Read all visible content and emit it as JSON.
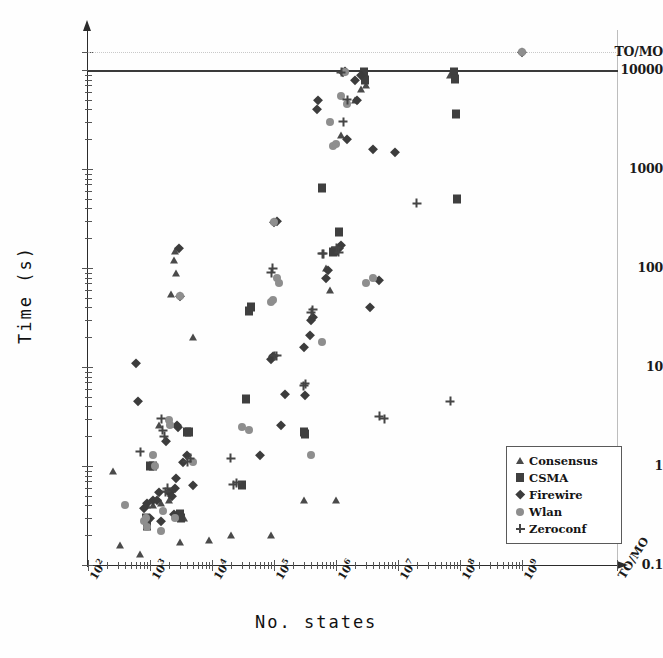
{
  "chart_data": {
    "type": "scatter",
    "title": "",
    "xlabel": "No. states",
    "ylabel": "Time (s)",
    "xscale": "log",
    "yscale": "log",
    "xlim": [
      100,
      1000000000
    ],
    "ylim": [
      0.1,
      10000
    ],
    "grid": false,
    "legend_position": "bottom-right",
    "x_tick_labels": [
      "10^2",
      "10^3",
      "10^4",
      "10^5",
      "10^6",
      "10^7",
      "10^8",
      "10^9",
      "TO/MO"
    ],
    "y_tick_labels": [
      "0.1",
      "1",
      "10",
      "100",
      "1000",
      "10000",
      "TO/MO"
    ],
    "threshold_line_solid": 10000,
    "threshold_line_dotted": "TO/MO",
    "series": [
      {
        "name": "Consensus",
        "marker": "triangle",
        "color": "#4a4a4a",
        "points": [
          [
            250,
            0.9
          ],
          [
            330,
            0.16
          ],
          [
            700,
            0.13
          ],
          [
            900,
            0.4
          ],
          [
            1100,
            0.4
          ],
          [
            1400,
            2.6
          ],
          [
            1500,
            0.42
          ],
          [
            2000,
            0.45
          ],
          [
            2200,
            55
          ],
          [
            2400,
            120
          ],
          [
            2500,
            150
          ],
          [
            2600,
            90
          ],
          [
            3000,
            0.17
          ],
          [
            3500,
            0.3
          ],
          [
            5000,
            20
          ],
          [
            9000,
            0.18
          ],
          [
            20000,
            0.2
          ],
          [
            90000,
            0.2
          ],
          [
            300000,
            0.45
          ],
          [
            700000,
            100
          ],
          [
            800000,
            60
          ],
          [
            900000,
            150
          ],
          [
            1000000,
            0.45
          ],
          [
            1200000,
            2200
          ],
          [
            2000000,
            5000
          ],
          [
            2500000,
            6500
          ],
          [
            3000000,
            7000
          ],
          [
            70000000,
            9000
          ]
        ]
      },
      {
        "name": "CSMA",
        "marker": "square",
        "color": "#3f3f3f",
        "points": [
          [
            850,
            0.3
          ],
          [
            900,
            0.25
          ],
          [
            1000,
            1.0
          ],
          [
            1100,
            1.0
          ],
          [
            3000,
            0.33
          ],
          [
            3200,
            0.3
          ],
          [
            4000,
            2.2
          ],
          [
            4200,
            2.2
          ],
          [
            30000,
            0.65
          ],
          [
            35000,
            4.8
          ],
          [
            40000,
            37
          ],
          [
            42000,
            40
          ],
          [
            300000,
            2.2
          ],
          [
            320000,
            2.1
          ],
          [
            600000,
            650
          ],
          [
            900000,
            145
          ],
          [
            950000,
            150
          ],
          [
            1100000,
            230
          ],
          [
            2800000,
            9500
          ],
          [
            2900000,
            8000
          ],
          [
            80000000,
            9500
          ],
          [
            82000000,
            8200
          ],
          [
            85000000,
            3600
          ],
          [
            90000000,
            500
          ]
        ]
      },
      {
        "name": "Firewire",
        "marker": "diamond",
        "color": "#3c3c3c",
        "points": [
          [
            600,
            11
          ],
          [
            650,
            4.5
          ],
          [
            800,
            0.38
          ],
          [
            900,
            0.42
          ],
          [
            1000,
            0.3
          ],
          [
            1100,
            0.45
          ],
          [
            1300,
            0.45
          ],
          [
            1400,
            0.55
          ],
          [
            1500,
            0.28
          ],
          [
            1800,
            1.8
          ],
          [
            2000,
            0.55
          ],
          [
            2100,
            0.55
          ],
          [
            2300,
            0.5
          ],
          [
            2400,
            0.33
          ],
          [
            2500,
            0.6
          ],
          [
            2600,
            0.75
          ],
          [
            2700,
            2.6
          ],
          [
            2800,
            2.5
          ],
          [
            2900,
            160
          ],
          [
            3000,
            52
          ],
          [
            3400,
            1.1
          ],
          [
            4000,
            1.3
          ],
          [
            5000,
            0.65
          ],
          [
            60000,
            1.3
          ],
          [
            90000,
            12
          ],
          [
            95000,
            13
          ],
          [
            100000,
            290
          ],
          [
            110000,
            300
          ],
          [
            130000,
            2.6
          ],
          [
            150000,
            5.3
          ],
          [
            300000,
            16
          ],
          [
            320000,
            5.2
          ],
          [
            380000,
            21
          ],
          [
            400000,
            30
          ],
          [
            420000,
            32
          ],
          [
            500000,
            4000
          ],
          [
            520000,
            5000
          ],
          [
            700000,
            80
          ],
          [
            750000,
            95
          ],
          [
            1100000,
            160
          ],
          [
            1200000,
            170
          ],
          [
            1300000,
            9500
          ],
          [
            1400000,
            9800
          ],
          [
            1500000,
            2000
          ],
          [
            2000000,
            8000
          ],
          [
            2200000,
            5000
          ],
          [
            2500000,
            9000
          ],
          [
            3500000,
            40
          ],
          [
            4000000,
            1600
          ],
          [
            5000000,
            75
          ],
          [
            9000000,
            1500
          ],
          [
            1000000000,
            12000
          ]
        ]
      },
      {
        "name": "Wlan",
        "marker": "circle",
        "color": "#8e8e8e",
        "points": [
          [
            400,
            0.4
          ],
          [
            800,
            0.28
          ],
          [
            850,
            0.3
          ],
          [
            900,
            0.24
          ],
          [
            1100,
            1.3
          ],
          [
            1200,
            1.0
          ],
          [
            1500,
            0.22
          ],
          [
            1600,
            0.35
          ],
          [
            2000,
            2.9
          ],
          [
            2100,
            2.6
          ],
          [
            2500,
            0.3
          ],
          [
            3000,
            52
          ],
          [
            5000,
            1.1
          ],
          [
            30000,
            2.5
          ],
          [
            40000,
            2.3
          ],
          [
            90000,
            45
          ],
          [
            95000,
            47
          ],
          [
            100000,
            290
          ],
          [
            110000,
            80
          ],
          [
            120000,
            70
          ],
          [
            400000,
            1.3
          ],
          [
            600000,
            18
          ],
          [
            800000,
            3000
          ],
          [
            900000,
            1700
          ],
          [
            1000000,
            1800
          ],
          [
            1200000,
            5500
          ],
          [
            1400000,
            9500
          ],
          [
            1500000,
            4500
          ],
          [
            3000000,
            70
          ],
          [
            4000000,
            80
          ],
          [
            1000000000,
            12000
          ]
        ]
      },
      {
        "name": "Zeroconf",
        "marker": "plus",
        "color": "#454545",
        "points": [
          [
            700,
            1.4
          ],
          [
            1500,
            3.0
          ],
          [
            1600,
            2.3
          ],
          [
            1700,
            2.0
          ],
          [
            1800,
            0.55
          ],
          [
            1900,
            0.6
          ],
          [
            4000,
            1.1
          ],
          [
            4500,
            1.2
          ],
          [
            20000,
            1.2
          ],
          [
            22000,
            0.65
          ],
          [
            25000,
            0.68
          ],
          [
            90000,
            90
          ],
          [
            95000,
            100
          ],
          [
            100000,
            13
          ],
          [
            110000,
            13
          ],
          [
            300000,
            6.5
          ],
          [
            320000,
            6.8
          ],
          [
            400000,
            36
          ],
          [
            420000,
            38
          ],
          [
            600000,
            140
          ],
          [
            620000,
            140
          ],
          [
            1000000,
            160
          ],
          [
            1100000,
            145
          ],
          [
            1200000,
            9500
          ],
          [
            1300000,
            3000
          ],
          [
            1500000,
            5000
          ],
          [
            5000000,
            3.2
          ],
          [
            6000000,
            3.0
          ],
          [
            20000000,
            450
          ],
          [
            70000000,
            4.5
          ]
        ]
      }
    ]
  },
  "legend": {
    "items": [
      {
        "label": "Consensus",
        "marker": "triangle"
      },
      {
        "label": "CSMA",
        "marker": "square"
      },
      {
        "label": "Firewire",
        "marker": "diamond"
      },
      {
        "label": "Wlan",
        "marker": "circle"
      },
      {
        "label": "Zeroconf",
        "marker": "plus"
      }
    ]
  }
}
